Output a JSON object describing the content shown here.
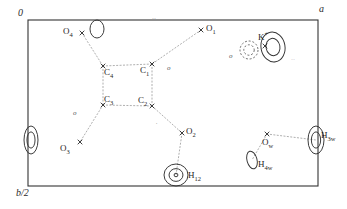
{
  "figure": {
    "type": "contour-map",
    "background": "#ffffff",
    "line_color": "#333333",
    "dash_color": "#9a9a9a"
  },
  "frame": {
    "x": 28,
    "y": 20,
    "width": 290,
    "height": 166,
    "corner_label_origin": "0",
    "corner_label_a": "a",
    "corner_label_b": "b/2"
  },
  "axes": [
    {
      "name": "origin-label",
      "text": "0",
      "x": 18,
      "y": 8
    },
    {
      "name": "a-axis-label",
      "text": "a",
      "x": 319,
      "y": 4
    },
    {
      "name": "b-half-axis-label",
      "text": "b/2",
      "x": 16,
      "y": 188
    }
  ],
  "atoms": [
    {
      "id": "O4",
      "label": "O",
      "sub": "4",
      "marker": "cross",
      "mx": 82,
      "my": 33,
      "lx": 63,
      "ly": 27
    },
    {
      "id": "O1",
      "label": "O",
      "sub": "1",
      "marker": "cross",
      "mx": 201,
      "my": 30,
      "lx": 206,
      "ly": 24
    },
    {
      "id": "C4",
      "label": "C",
      "sub": "4",
      "marker": "cross",
      "mx": 103,
      "my": 66,
      "lx": 104,
      "ly": 68
    },
    {
      "id": "C1",
      "label": "C",
      "sub": "1",
      "marker": "cross",
      "mx": 152,
      "my": 64,
      "lx": 140,
      "ly": 66
    },
    {
      "id": "C3",
      "label": "C",
      "sub": "3",
      "marker": "cross",
      "mx": 103,
      "my": 105,
      "lx": 104,
      "ly": 95
    },
    {
      "id": "C2",
      "label": "C",
      "sub": "2",
      "marker": "cross",
      "mx": 152,
      "my": 106,
      "lx": 138,
      "ly": 96
    },
    {
      "id": "O2",
      "label": "O",
      "sub": "2",
      "marker": "cross",
      "mx": 182,
      "my": 133,
      "lx": 186,
      "ly": 127
    },
    {
      "id": "O3",
      "label": "O",
      "sub": "3",
      "marker": "cross",
      "mx": 80,
      "my": 142,
      "lx": 60,
      "ly": 144
    },
    {
      "id": "Kp",
      "label": "K",
      "sup": "+",
      "marker": "cross",
      "mx": 265,
      "my": 46,
      "lx": 258,
      "ly": 31
    },
    {
      "id": "Ow",
      "label": "O",
      "sub": "w",
      "marker": "cross",
      "mx": 267,
      "my": 134,
      "lx": 262,
      "ly": 138
    },
    {
      "id": "H12",
      "label": "H",
      "sub": "12",
      "marker": "none",
      "mx": 176,
      "my": 175,
      "lx": 188,
      "ly": 171
    },
    {
      "id": "H3w",
      "label": "H",
      "sub": "3w",
      "marker": "none",
      "mx": 316,
      "my": 140,
      "lx": 321,
      "ly": 131
    },
    {
      "id": "H4w",
      "label": "H",
      "sub": "4w",
      "marker": "none",
      "mx": 252,
      "my": 160,
      "lx": 258,
      "ly": 160
    }
  ],
  "bonds": [
    {
      "from": "O4",
      "to": "C4"
    },
    {
      "from": "O1",
      "to": "C1"
    },
    {
      "from": "C4",
      "to": "C1"
    },
    {
      "from": "C4",
      "to": "C3"
    },
    {
      "from": "C1",
      "to": "C2"
    },
    {
      "from": "C3",
      "to": "C2"
    },
    {
      "from": "C3",
      "to": "O3"
    },
    {
      "from": "C2",
      "to": "O2"
    },
    {
      "from": "O2",
      "to": "H12"
    },
    {
      "from": "Ow",
      "to": "H3w"
    },
    {
      "from": "Ow",
      "to": "H4w"
    }
  ],
  "contour_peaks": [
    {
      "name": "peak-O4-lobe",
      "cx": 97,
      "cy": 29,
      "rx": 7,
      "ry": 9,
      "rings": 1,
      "style": "solid",
      "rot": 0
    },
    {
      "name": "peak-K-positive",
      "cx": 273,
      "cy": 47,
      "rx": 12,
      "ry": 15,
      "rings": 2,
      "style": "solid",
      "rot": -10
    },
    {
      "name": "peak-K-negative",
      "cx": 249,
      "cy": 50,
      "rx": 9,
      "ry": 9,
      "rings": 2,
      "style": "dashed",
      "rot": 0
    },
    {
      "name": "peak-H12",
      "cx": 176,
      "cy": 175,
      "rx": 12,
      "ry": 11,
      "rings": 3,
      "style": "solid",
      "rot": 0
    },
    {
      "name": "peak-H3w",
      "cx": 316,
      "cy": 140,
      "rx": 8,
      "ry": 14,
      "rings": 2,
      "style": "solid",
      "rot": 0
    },
    {
      "name": "peak-H4w",
      "cx": 252,
      "cy": 160,
      "rx": 5,
      "ry": 9,
      "rings": 1,
      "style": "solid",
      "rot": -15
    },
    {
      "name": "peak-left-edge",
      "cx": 31,
      "cy": 140,
      "rx": 7,
      "ry": 14,
      "rings": 2,
      "style": "solid",
      "rot": 0
    }
  ],
  "minor_marks": [
    {
      "name": "noise-mark-top",
      "text": "··",
      "x": 152,
      "y": 16
    },
    {
      "name": "noise-mark-o-right",
      "text": "o",
      "x": 229,
      "y": 53
    },
    {
      "name": "noise-mark-c1",
      "text": "o",
      "x": 167,
      "y": 65
    },
    {
      "name": "noise-mark-kr",
      "text": "˙˙",
      "x": 291,
      "y": 58
    },
    {
      "name": "noise-mark-left",
      "text": "o",
      "x": 73,
      "y": 110
    },
    {
      "name": "noise-mark-mid",
      "text": "˙",
      "x": 155,
      "y": 122
    }
  ]
}
